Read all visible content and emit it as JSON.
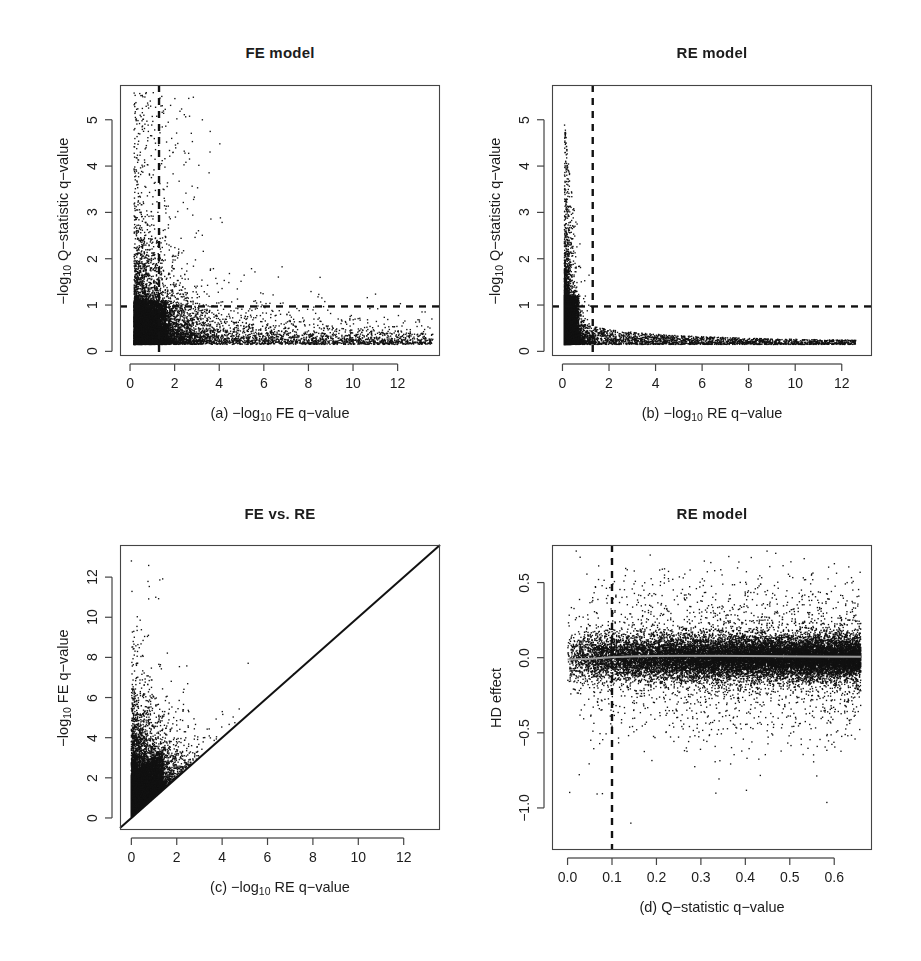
{
  "figure": {
    "width": 921,
    "height": 961,
    "background": "#ffffff",
    "point_color": "#111111",
    "axis_color": "#444444",
    "guide_color": "#111111",
    "trend_color": "#9a9a9a"
  },
  "panels": [
    {
      "key": "a",
      "title": "FE model",
      "xlabel_prefix": "(a)  −log",
      "xlabel_sub": "10",
      "xlabel_suffix": " FE q−value",
      "ylabel_prefix": "−log",
      "ylabel_sub": "10",
      "ylabel_suffix": " Q−statistic q−value",
      "box": {
        "left": 120,
        "top": 85,
        "right": 440,
        "bottom": 356
      },
      "title_y": 44,
      "chart_data": {
        "type": "scatter",
        "title": "FE model",
        "xlabel": "(a) −log10 FE q−value",
        "ylabel": "−log10 Q−statistic q−value",
        "xlim": [
          -0.45,
          13.9
        ],
        "ylim": [
          -0.1,
          5.75
        ],
        "xticks": [
          0,
          2,
          4,
          6,
          8,
          10,
          12
        ],
        "yticks": [
          0,
          1,
          2,
          3,
          4,
          5
        ],
        "xticklabels": [
          "0",
          "2",
          "4",
          "6",
          "8",
          "10",
          "12"
        ],
        "yticklabels": [
          "0",
          "1",
          "2",
          "3",
          "4",
          "5"
        ],
        "grid": false,
        "legend": "none",
        "n_points": 9000,
        "cloud": {
          "model": "exponential-decay-dense-corner",
          "x_floor": 0.18,
          "y_floor": 0.15,
          "x_scale": 1.55,
          "y_scale": 0.55,
          "x_tail_fraction": 0.3,
          "x_tail_max": 13.6,
          "y_tail_fraction": 0.05,
          "y_tail_max": 5.6
        },
        "guides": [
          {
            "name": "significance-threshold-vertical",
            "orientation": "vertical",
            "value": 1.3,
            "style": "dashed"
          },
          {
            "name": "significance-threshold-horizontal",
            "orientation": "horizontal",
            "value": 0.97,
            "style": "dashed"
          }
        ]
      }
    },
    {
      "key": "b",
      "title": "RE model",
      "xlabel_prefix": "(b)  −log",
      "xlabel_sub": "10",
      "xlabel_suffix": " RE q−value",
      "ylabel_prefix": "−log",
      "ylabel_sub": "10",
      "ylabel_suffix": " Q−statistic q−value",
      "box": {
        "left": 552,
        "top": 85,
        "right": 872,
        "bottom": 356
      },
      "title_y": 44,
      "chart_data": {
        "type": "scatter",
        "title": "RE model",
        "xlabel": "(b) −log10 RE q−value",
        "ylabel": "−log10 Q−statistic q−value",
        "xlim": [
          -0.45,
          13.3
        ],
        "ylim": [
          -0.1,
          5.75
        ],
        "xticks": [
          0,
          2,
          4,
          6,
          8,
          10,
          12
        ],
        "yticks": [
          0,
          1,
          2,
          3,
          4,
          5
        ],
        "xticklabels": [
          "0",
          "2",
          "4",
          "6",
          "8",
          "10",
          "12"
        ],
        "yticklabels": [
          "0",
          "1",
          "2",
          "3",
          "4",
          "5"
        ],
        "grid": false,
        "legend": "none",
        "n_points": 9000,
        "cloud": {
          "model": "hyperbolic-L-shape",
          "x_floor": 0.08,
          "y_floor": 0.15,
          "x_scale": 0.55,
          "y_scale": 0.4,
          "x_tail_fraction": 0.26,
          "x_tail_max": 12.6,
          "y_tail_fraction": 0.04,
          "y_tail_max": 5.6,
          "exclusion": "points with high x have low y (mutually exclusive tails)"
        },
        "guides": [
          {
            "name": "significance-threshold-vertical",
            "orientation": "vertical",
            "value": 1.3,
            "style": "dashed"
          },
          {
            "name": "significance-threshold-horizontal",
            "orientation": "horizontal",
            "value": 0.97,
            "style": "dashed"
          }
        ]
      }
    },
    {
      "key": "c",
      "title": "FE vs. RE",
      "xlabel_prefix": "(c)  −log",
      "xlabel_sub": "10",
      "xlabel_suffix": " RE q−value",
      "ylabel_prefix": "−log",
      "ylabel_sub": "10",
      "ylabel_suffix": " FE q−value",
      "box": {
        "left": 120,
        "top": 545,
        "right": 440,
        "bottom": 830
      },
      "title_y": 505,
      "chart_data": {
        "type": "scatter",
        "title": "FE vs. RE",
        "xlabel": "(c) −log10 RE q−value",
        "ylabel": "−log10 FE q−value",
        "xlim": [
          -0.5,
          13.6
        ],
        "ylim": [
          -0.6,
          13.6
        ],
        "xticks": [
          0,
          2,
          4,
          6,
          8,
          10,
          12
        ],
        "yticks": [
          0,
          2,
          4,
          6,
          8,
          10,
          12
        ],
        "xticklabels": [
          "0",
          "2",
          "4",
          "6",
          "8",
          "10",
          "12"
        ],
        "yticklabels": [
          "0",
          "2",
          "4",
          "6",
          "8",
          "10",
          "12"
        ],
        "grid": false,
        "legend": "none",
        "n_points": 9000,
        "cloud": {
          "model": "above-identity-wedge",
          "description": "all points lie on or above the y=x identity line; dense near origin, fan upward-left",
          "x_scale": 0.9,
          "excess_scale": 1.1,
          "ridge_fraction": 0.04,
          "ridge_offset": 0.35
        },
        "guides": [
          {
            "name": "identity-line",
            "orientation": "diagonal",
            "slope": 1,
            "intercept": 0,
            "style": "solid"
          }
        ]
      }
    },
    {
      "key": "d",
      "title": "RE model",
      "xlabel_prefix": "(d)  Q−statistic q−value",
      "xlabel_sub": "",
      "xlabel_suffix": "",
      "ylabel_prefix": "HD effect",
      "ylabel_sub": "",
      "ylabel_suffix": "",
      "box": {
        "left": 552,
        "top": 545,
        "right": 872,
        "bottom": 850
      },
      "title_y": 505,
      "chart_data": {
        "type": "scatter",
        "title": "RE model",
        "xlabel": "(d) Q−statistic q−value",
        "ylabel": "HD effect",
        "xlim": [
          -0.035,
          0.685
        ],
        "ylim": [
          -1.28,
          0.75
        ],
        "xticks": [
          0.0,
          0.1,
          0.2,
          0.3,
          0.4,
          0.5,
          0.6
        ],
        "yticks": [
          -1.0,
          -0.5,
          0.0,
          0.5
        ],
        "xticklabels": [
          "0.0",
          "0.1",
          "0.2",
          "0.3",
          "0.4",
          "0.5",
          "0.6"
        ],
        "yticklabels": [
          "−1.0",
          "−0.5",
          "0.0",
          "0.5"
        ],
        "grid": false,
        "legend": "none",
        "n_points": 14000,
        "cloud": {
          "model": "horizontal-band-heteroscedastic",
          "band_center": 0.0,
          "band_sigma_core": 0.075,
          "band_sigma_tail": 0.26,
          "tail_fraction": 0.18,
          "x_density": "increasing toward 0.65, hard right edge at 0.66",
          "x_max": 0.66
        },
        "guides": [
          {
            "name": "q-value-threshold-vertical",
            "orientation": "vertical",
            "value": 0.1,
            "style": "dashed"
          },
          {
            "name": "loess-trend-line",
            "orientation": "trend",
            "style": "solid-gray",
            "points": [
              [
                0.0,
                -0.012
              ],
              [
                0.05,
                -0.008
              ],
              [
                0.1,
                0.004
              ],
              [
                0.15,
                0.009
              ],
              [
                0.2,
                0.011
              ],
              [
                0.25,
                0.012
              ],
              [
                0.3,
                0.012
              ],
              [
                0.35,
                0.012
              ],
              [
                0.4,
                0.011
              ],
              [
                0.45,
                0.01
              ],
              [
                0.5,
                0.009
              ],
              [
                0.55,
                0.008
              ],
              [
                0.6,
                0.007
              ],
              [
                0.66,
                0.006
              ]
            ]
          }
        ]
      }
    }
  ]
}
